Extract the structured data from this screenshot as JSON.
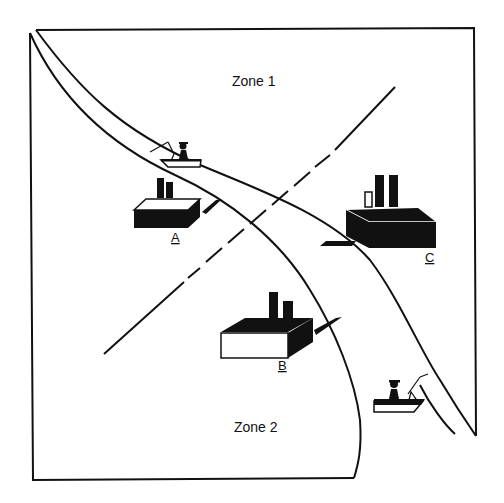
{
  "zones": [
    {
      "id": "zone1",
      "label": "Zone 1"
    },
    {
      "id": "zone2",
      "label": "Zone 2"
    }
  ],
  "plants": [
    {
      "id": "A",
      "label": "A",
      "style": "dark body"
    },
    {
      "id": "B",
      "label": "B",
      "style": "white body"
    },
    {
      "id": "C",
      "label": "C",
      "style": "dark body, two tall stacks and one hollow stack"
    }
  ],
  "boats": [
    {
      "id": "boat-upper",
      "description": "fisherman in boat on upper river"
    },
    {
      "id": "boat-lower",
      "description": "fisherman in boat on lower river bank"
    }
  ],
  "features": {
    "river": "two curved banks running from top-left to bottom-right",
    "zone_boundary": "dashed diagonal line from lower-left to upper-right"
  },
  "colors": {
    "ink": "#111111",
    "background": "#ffffff"
  }
}
